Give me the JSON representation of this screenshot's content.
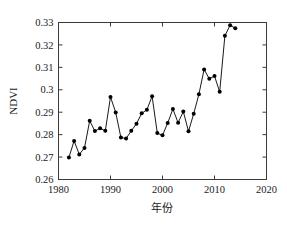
{
  "chart_data": {
    "type": "line",
    "title": "",
    "xlabel": "年份",
    "ylabel": "NDVI",
    "xlim": [
      1980,
      2020
    ],
    "ylim": [
      0.26,
      0.33
    ],
    "xticks": [
      1980,
      1990,
      2000,
      2010,
      2020
    ],
    "xtick_labels": [
      "1980",
      "1990",
      "2000",
      "2010",
      "2020"
    ],
    "yticks": [
      0.26,
      0.27,
      0.28,
      0.29,
      0.3,
      0.31,
      0.32,
      0.33
    ],
    "ytick_labels": [
      "0.26",
      "0.27",
      "0.28",
      "0.29",
      "0.3",
      "0.31",
      "0.32",
      "0.33"
    ],
    "grid": false,
    "legend": null,
    "marker": "filled-circle",
    "line_color": "#000000",
    "marker_color": "#000000",
    "x": [
      1982,
      1983,
      1984,
      1985,
      1986,
      1987,
      1988,
      1989,
      1990,
      1991,
      1992,
      1993,
      1994,
      1995,
      1996,
      1997,
      1998,
      1999,
      2000,
      2001,
      2002,
      2003,
      2004,
      2005,
      2006,
      2007,
      2008,
      2009,
      2010,
      2011,
      2012,
      2013,
      2014
    ],
    "values": [
      0.2698,
      0.2772,
      0.2712,
      0.2741,
      0.2862,
      0.2816,
      0.2828,
      0.2817,
      0.2968,
      0.2899,
      0.2787,
      0.2783,
      0.2817,
      0.2849,
      0.2895,
      0.2911,
      0.2971,
      0.2807,
      0.2797,
      0.2852,
      0.2914,
      0.2853,
      0.2903,
      0.2815,
      0.2893,
      0.298,
      0.3091,
      0.3049,
      0.3061,
      0.2991,
      0.3241,
      0.3288,
      0.3274
    ],
    "series": [
      {
        "name": "NDVI",
        "x": [
          1982,
          1983,
          1984,
          1985,
          1986,
          1987,
          1988,
          1989,
          1990,
          1991,
          1992,
          1993,
          1994,
          1995,
          1996,
          1997,
          1998,
          1999,
          2000,
          2001,
          2002,
          2003,
          2004,
          2005,
          2006,
          2007,
          2008,
          2009,
          2010,
          2011,
          2012,
          2013,
          2014
        ],
        "values": [
          0.2698,
          0.2772,
          0.2712,
          0.2741,
          0.2862,
          0.2816,
          0.2828,
          0.2817,
          0.2968,
          0.2899,
          0.2787,
          0.2783,
          0.2817,
          0.2849,
          0.2895,
          0.2911,
          0.2971,
          0.2807,
          0.2797,
          0.2852,
          0.2914,
          0.2853,
          0.2903,
          0.2815,
          0.2893,
          0.298,
          0.3091,
          0.3049,
          0.3061,
          0.2991,
          0.3241,
          0.3288,
          0.3274
        ]
      }
    ]
  }
}
